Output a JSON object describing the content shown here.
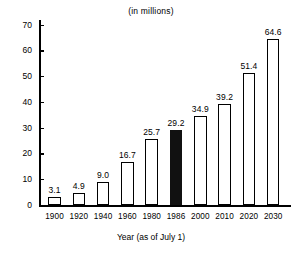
{
  "chart_data": {
    "type": "bar",
    "title": "(in millions)",
    "xlabel": "Year (as of July 1)",
    "ylabel": "",
    "categories": [
      "1900",
      "1920",
      "1940",
      "1960",
      "1980",
      "1986",
      "2000",
      "2010",
      "2020",
      "2030"
    ],
    "values": [
      3.1,
      4.9,
      9.0,
      16.7,
      25.7,
      29.2,
      34.9,
      39.2,
      51.4,
      64.6
    ],
    "value_labels": [
      "3.1",
      "4.9",
      "9.0",
      "16.7",
      "25.7",
      "29.2",
      "34.9",
      "39.2",
      "51.4",
      "64.6"
    ],
    "highlighted_index": 5,
    "highlight_color": "#111111",
    "bar_fill_color": "#ffffff",
    "bar_edge_color": "#000000",
    "ylim": [
      0,
      72
    ],
    "yticks": [
      0,
      10,
      20,
      30,
      40,
      50,
      60,
      70
    ],
    "ytick_labels": [
      "0",
      "10",
      "20",
      "30",
      "40",
      "50",
      "60",
      "70"
    ],
    "grid": false,
    "legend": false
  }
}
